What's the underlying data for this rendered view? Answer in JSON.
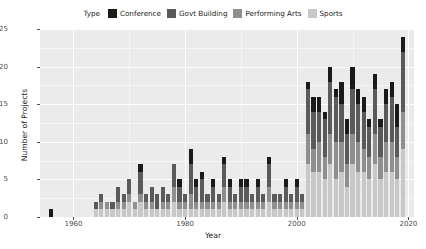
{
  "chart_data": {
    "type": "bar",
    "title": "",
    "subtitle": "",
    "xlabel": "Year",
    "ylabel": "Number of Projects",
    "xlim": [
      1954,
      2021
    ],
    "ylim": [
      0,
      25
    ],
    "xticks": [
      1960,
      1980,
      2000,
      2020
    ],
    "yticks": [
      0,
      5,
      10,
      15,
      20,
      25
    ],
    "grid": true,
    "stacked": true,
    "legend_title": "Type",
    "legend_position": "top",
    "stack_order_bottom_to_top": [
      "Sports",
      "Performing Arts",
      "Govt Building",
      "Conference"
    ],
    "series": [
      {
        "name": "Conference",
        "color": "#1a1a1a",
        "values": [
          1,
          0,
          0,
          0,
          0,
          0,
          0,
          0,
          0,
          0,
          0,
          0,
          0,
          0,
          0,
          0,
          1,
          0,
          0,
          0,
          0,
          0,
          0,
          1,
          0,
          2,
          1,
          1,
          0,
          1,
          0,
          1,
          1,
          0,
          1,
          1,
          0,
          1,
          0,
          1,
          0,
          0,
          1,
          0,
          1,
          0,
          1,
          2,
          2,
          1,
          2,
          1,
          3,
          2,
          3,
          2,
          2,
          1,
          2,
          1,
          2,
          2,
          3,
          2
        ]
      },
      {
        "name": "Govt Building",
        "color": "#5a5a5a",
        "values": [
          0,
          0,
          0,
          0,
          0,
          0,
          0,
          0,
          1,
          1,
          0,
          1,
          2,
          1,
          2,
          0,
          3,
          1,
          2,
          2,
          2,
          1,
          3,
          2,
          1,
          4,
          2,
          3,
          1,
          2,
          1,
          3,
          2,
          1,
          2,
          2,
          1,
          2,
          1,
          3,
          1,
          1,
          2,
          1,
          2,
          1,
          6,
          5,
          4,
          5,
          7,
          6,
          5,
          4,
          6,
          5,
          5,
          4,
          6,
          4,
          5,
          6,
          4,
          8
        ]
      },
      {
        "name": "Performing Arts",
        "color": "#8f8f8f",
        "values": [
          0,
          0,
          0,
          0,
          0,
          0,
          0,
          0,
          0,
          1,
          1,
          0,
          1,
          1,
          1,
          1,
          1,
          1,
          1,
          0,
          1,
          1,
          2,
          1,
          1,
          2,
          1,
          1,
          1,
          1,
          1,
          2,
          1,
          1,
          1,
          1,
          1,
          1,
          1,
          2,
          1,
          1,
          1,
          1,
          1,
          1,
          4,
          3,
          4,
          3,
          4,
          5,
          4,
          3,
          4,
          4,
          3,
          3,
          4,
          3,
          4,
          4,
          3,
          5
        ]
      },
      {
        "name": "Sports",
        "color": "#c8c8c8",
        "values": [
          0,
          0,
          0,
          0,
          0,
          0,
          0,
          0,
          1,
          1,
          1,
          1,
          1,
          1,
          2,
          1,
          2,
          1,
          1,
          1,
          1,
          1,
          2,
          1,
          1,
          1,
          1,
          1,
          1,
          1,
          1,
          2,
          1,
          1,
          1,
          1,
          1,
          1,
          1,
          2,
          1,
          1,
          1,
          1,
          1,
          1,
          7,
          6,
          6,
          5,
          7,
          5,
          6,
          4,
          7,
          6,
          6,
          5,
          7,
          5,
          6,
          6,
          5,
          9
        ]
      }
    ],
    "categories": [
      1956,
      1957,
      1958,
      1959,
      1960,
      1961,
      1962,
      1963,
      1964,
      1965,
      1966,
      1967,
      1968,
      1969,
      1970,
      1971,
      1972,
      1973,
      1974,
      1975,
      1976,
      1977,
      1978,
      1979,
      1980,
      1981,
      1982,
      1983,
      1984,
      1985,
      1986,
      1987,
      1988,
      1989,
      1990,
      1991,
      1992,
      1993,
      1994,
      1995,
      1996,
      1997,
      1998,
      1999,
      2000,
      2001,
      2002,
      2003,
      2004,
      2005,
      2006,
      2007,
      2008,
      2009,
      2010,
      2011,
      2012,
      2013,
      2014,
      2015,
      2016,
      2017,
      2018,
      2019
    ]
  },
  "style": {
    "panel_background": "#ebebeb",
    "grid_color": "#ffffff",
    "axis_text_color": "#4d4d4d",
    "label_color": "#1a1a1a",
    "page_background": "#ffffff"
  }
}
